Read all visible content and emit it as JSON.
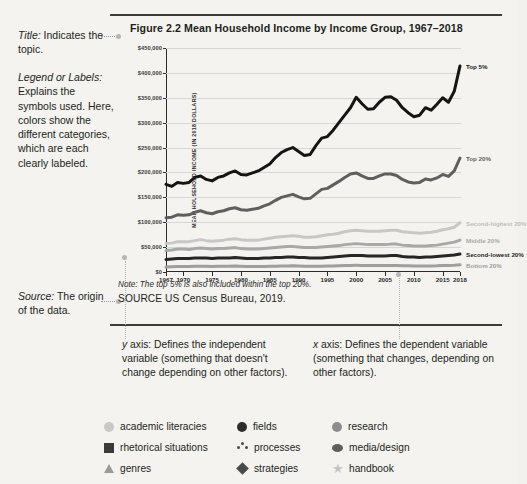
{
  "annotations": {
    "title_note": {
      "label": "Title:",
      "text": " Indicates the topic."
    },
    "legend_note": {
      "label": "Legend or Labels:",
      "text": "Explains the symbols used. Here, colors show the different categories, which are each clearly labeled."
    },
    "source_note": {
      "label": "Source:",
      "text": " The origin of the data."
    },
    "y_axis_note": {
      "label": "y",
      "text": " axis: Defines the independent variable (something that doesn't change depending on other factors)."
    },
    "x_axis_note": {
      "label": "x",
      "text": " axis: Defines the dependent variable (something that changes, depending on other factors)."
    }
  },
  "figure": {
    "title": "Figure 2.2  Mean Household Income by Income Group, 1967–2018",
    "note": "Note: The top 5% is also included within the top 20%.",
    "source": "SOURCE  US Census Bureau, 2019."
  },
  "chart_data": {
    "type": "line",
    "title": "Figure 2.2  Mean Household Income by Income Group, 1967–2018",
    "xlabel": "",
    "ylabel": "MEAN HOUSEHOLD INCOME (IN 2018 DOLLARS)",
    "xlim": [
      1967,
      2018
    ],
    "ylim": [
      0,
      450000
    ],
    "grid": true,
    "legend_position": "right-of-line-ends",
    "xticks": [
      "1967",
      "1970",
      "1975",
      "1980",
      "1985",
      "1990",
      "1995",
      "2000",
      "2005",
      "2010",
      "2015",
      "2018"
    ],
    "xtick_values": [
      1967,
      1970,
      1975,
      1980,
      1985,
      1990,
      1995,
      2000,
      2005,
      2010,
      2015,
      2018
    ],
    "yticks": [
      "$0",
      "$50,000",
      "$100,000",
      "$150,000",
      "$200,000",
      "$250,000",
      "$300,000",
      "$350,000",
      "$400,000",
      "$450,000"
    ],
    "ytick_values": [
      0,
      50000,
      100000,
      150000,
      200000,
      250000,
      300000,
      350000,
      400000,
      450000
    ],
    "x": [
      1967,
      1968,
      1969,
      1970,
      1971,
      1972,
      1973,
      1974,
      1975,
      1976,
      1977,
      1978,
      1979,
      1980,
      1981,
      1982,
      1983,
      1984,
      1985,
      1986,
      1987,
      1988,
      1989,
      1990,
      1991,
      1992,
      1993,
      1994,
      1995,
      1996,
      1997,
      1998,
      1999,
      2000,
      2001,
      2002,
      2003,
      2004,
      2005,
      2006,
      2007,
      2008,
      2009,
      2010,
      2011,
      2012,
      2013,
      2014,
      2015,
      2016,
      2017,
      2018
    ],
    "series": [
      {
        "name": "Top 5%",
        "color": "#151515",
        "values": [
          176000,
          172000,
          180000,
          178000,
          180000,
          190000,
          193000,
          186000,
          183000,
          190000,
          193000,
          199000,
          203000,
          196000,
          195000,
          199000,
          203000,
          210000,
          217000,
          230000,
          240000,
          246000,
          250000,
          242000,
          234000,
          236000,
          254000,
          269000,
          272000,
          285000,
          300000,
          315000,
          330000,
          351000,
          338000,
          327000,
          328000,
          341000,
          351000,
          352000,
          345000,
          330000,
          320000,
          312000,
          315000,
          330000,
          325000,
          337000,
          350000,
          341000,
          363000,
          414000
        ]
      },
      {
        "name": "Top 20%",
        "color": "#5f5f5f",
        "values": [
          109000,
          110000,
          115000,
          114000,
          115000,
          120000,
          123000,
          119000,
          117000,
          121000,
          123000,
          127000,
          129000,
          125000,
          124000,
          126000,
          128000,
          133000,
          137000,
          144000,
          150000,
          153000,
          156000,
          151000,
          147000,
          148000,
          157000,
          166000,
          168000,
          175000,
          182000,
          190000,
          197000,
          199000,
          193000,
          188000,
          188000,
          193000,
          197000,
          197000,
          194000,
          186000,
          181000,
          179000,
          180000,
          187000,
          185000,
          189000,
          196000,
          192000,
          203000,
          229000
        ]
      },
      {
        "name": "Second-highest 20%",
        "color": "#c7c7c7",
        "values": [
          57000,
          58000,
          61000,
          61000,
          61000,
          63000,
          65000,
          63000,
          62000,
          63000,
          64000,
          66000,
          67000,
          65000,
          64000,
          64000,
          64000,
          66000,
          68000,
          70000,
          71000,
          72000,
          73000,
          72000,
          70000,
          70000,
          71000,
          73000,
          75000,
          76000,
          78000,
          81000,
          83000,
          84000,
          83000,
          82000,
          82000,
          82000,
          83000,
          84000,
          84000,
          81000,
          80000,
          79000,
          78000,
          79000,
          80000,
          82000,
          85000,
          87000,
          90000,
          99000
        ]
      },
      {
        "name": "Middle 20%",
        "color": "#a8a8a8",
        "values": [
          43000,
          44000,
          46000,
          46000,
          45000,
          47000,
          48000,
          47000,
          46000,
          47000,
          47000,
          48000,
          49000,
          47000,
          46000,
          46000,
          46000,
          47000,
          48000,
          49000,
          50000,
          51000,
          51000,
          50000,
          49000,
          49000,
          49000,
          50000,
          51000,
          52000,
          53000,
          55000,
          56000,
          57000,
          56000,
          55000,
          55000,
          55000,
          55000,
          56000,
          56000,
          54000,
          53000,
          52000,
          52000,
          52000,
          53000,
          54000,
          56000,
          58000,
          60000,
          64000
        ]
      },
      {
        "name": "Second-lowest 20%",
        "color": "#262626",
        "values": [
          25000,
          26000,
          27000,
          27000,
          27000,
          28000,
          28000,
          28000,
          27000,
          28000,
          28000,
          28000,
          29000,
          28000,
          27000,
          27000,
          27000,
          28000,
          28000,
          29000,
          29000,
          30000,
          30000,
          29000,
          29000,
          28000,
          28000,
          28000,
          29000,
          30000,
          31000,
          32000,
          33000,
          33000,
          33000,
          32000,
          32000,
          32000,
          32000,
          33000,
          33000,
          31000,
          30000,
          30000,
          29000,
          30000,
          30000,
          31000,
          32000,
          33000,
          34000,
          36000
        ]
      },
      {
        "name": "Bottom 20%",
        "color": "#9e9e9e",
        "values": [
          10000,
          10500,
          11000,
          11000,
          11000,
          11500,
          11800,
          11500,
          11200,
          11400,
          11500,
          11800,
          12000,
          11500,
          11200,
          11000,
          11000,
          11200,
          11400,
          11700,
          12000,
          12200,
          12400,
          12100,
          11800,
          11700,
          11600,
          11700,
          12000,
          12300,
          12600,
          13000,
          13300,
          13400,
          13300,
          13000,
          12900,
          12900,
          13000,
          13200,
          13200,
          12700,
          12400,
          12200,
          12000,
          12100,
          12200,
          12400,
          12900,
          13300,
          13700,
          14400
        ]
      }
    ]
  },
  "bottom_legend": {
    "items": [
      {
        "label": "academic literacies",
        "symbol": "circle-icon",
        "color": "#c9c9c9"
      },
      {
        "label": "fields",
        "symbol": "circle-icon",
        "color": "#2d2d2d"
      },
      {
        "label": "research",
        "symbol": "circle-icon",
        "color": "#8d8d8d"
      },
      {
        "label": "rhetorical situations",
        "symbol": "square-icon",
        "color": "#3b3b3b"
      },
      {
        "label": "processes",
        "symbol": "three-dots-icon",
        "color": "#4a4a4a"
      },
      {
        "label": "media/design",
        "symbol": "ellipse-icon",
        "color": "#5e5e5e"
      },
      {
        "label": "genres",
        "symbol": "triangle-icon",
        "color": "#9a9a9a"
      },
      {
        "label": "strategies",
        "symbol": "diamond-icon",
        "color": "#4a4a4a"
      },
      {
        "label": "handbook",
        "symbol": "star-icon",
        "color": "#c3c3c3"
      }
    ]
  }
}
